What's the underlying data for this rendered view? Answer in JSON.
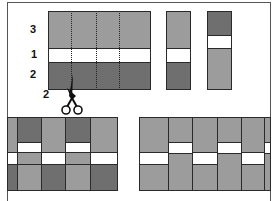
{
  "diagram": {
    "colors": {
      "light": "#9c9c9c",
      "dark": "#6f6f6f",
      "band": "#ffffff",
      "outline": "#2a2a2a"
    },
    "labels": {
      "top_band": "3",
      "middle_band": "1",
      "bottom_band": "2",
      "cut_width": "2"
    },
    "icons": {
      "scissors": "scissors-icon"
    }
  }
}
